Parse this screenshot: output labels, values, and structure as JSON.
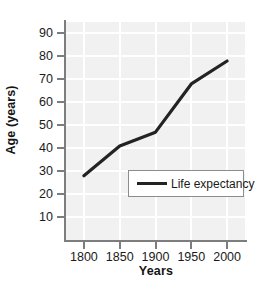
{
  "chart_data": {
    "type": "line",
    "title": "",
    "xlabel": "Years",
    "ylabel": "Age (years)",
    "x": [
      1800,
      1850,
      1900,
      1950,
      2000
    ],
    "xticklabels": [
      "1800",
      "1850",
      "1900",
      "1950",
      "2000"
    ],
    "xlim": [
      1775,
      2025
    ],
    "yticks": [
      10,
      20,
      30,
      40,
      50,
      60,
      70,
      80,
      90
    ],
    "yticklabels": [
      "10",
      "20",
      "30",
      "40",
      "50",
      "60",
      "70",
      "80",
      "90"
    ],
    "ylim": [
      0,
      95
    ],
    "grid": true,
    "legend_position": "center",
    "series": [
      {
        "name": "Life expectancy",
        "values": [
          28,
          41,
          47,
          68,
          78
        ],
        "color": "#232323",
        "linewidth": 3.2
      }
    ],
    "plot_background": "#f1f1f1",
    "gridline_color": "#ffffff",
    "axis_color": "#7d7d7d",
    "figure_background": "#ffffff"
  },
  "legend": {
    "entries": [
      {
        "label": "Life expectancy"
      }
    ]
  }
}
